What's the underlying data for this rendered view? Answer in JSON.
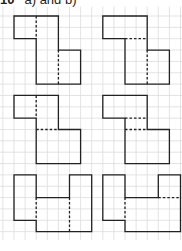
{
  "header": {
    "number": "10",
    "label": "a) and b)"
  },
  "grid": {
    "origin_x": 14,
    "origin_y": 16,
    "cell_w": 11.1,
    "cell_h": 11.35,
    "i_min": -1,
    "i_max": 16,
    "j_min": -1,
    "j_max": 20,
    "color": "#dcdcdc"
  },
  "style": {
    "outline_color": "#222222",
    "dash_color": "#222222"
  },
  "shapes": [
    {
      "name": "shape-row1-left",
      "outline": [
        [
          0,
          0
        ],
        [
          4,
          0
        ],
        [
          4,
          3
        ],
        [
          6,
          3
        ],
        [
          6,
          6
        ],
        [
          2,
          6
        ],
        [
          2,
          2
        ],
        [
          0,
          2
        ]
      ],
      "dashes": [
        [
          [
            2,
            0
          ],
          [
            2,
            2
          ]
        ],
        [
          [
            4,
            3
          ],
          [
            4,
            6
          ]
        ]
      ]
    },
    {
      "name": "shape-row1-right",
      "outline": [
        [
          8,
          0
        ],
        [
          12,
          0
        ],
        [
          12,
          3
        ],
        [
          14,
          3
        ],
        [
          14,
          6
        ],
        [
          10,
          6
        ],
        [
          10,
          2
        ],
        [
          8,
          2
        ]
      ],
      "dashes": [
        [
          [
            10,
            2
          ],
          [
            12,
            2
          ]
        ],
        [
          [
            12,
            3
          ],
          [
            12,
            6
          ]
        ]
      ]
    },
    {
      "name": "shape-row2-left",
      "outline": [
        [
          0,
          7
        ],
        [
          4,
          7
        ],
        [
          4,
          10
        ],
        [
          6,
          10
        ],
        [
          6,
          13
        ],
        [
          2,
          13
        ],
        [
          2,
          9
        ],
        [
          0,
          9
        ]
      ],
      "dashes": [
        [
          [
            2,
            7
          ],
          [
            2,
            9
          ]
        ],
        [
          [
            2,
            10
          ],
          [
            4,
            10
          ]
        ]
      ]
    },
    {
      "name": "shape-row2-right",
      "outline": [
        [
          8,
          7
        ],
        [
          12,
          7
        ],
        [
          12,
          10
        ],
        [
          14,
          10
        ],
        [
          14,
          13
        ],
        [
          10,
          13
        ],
        [
          10,
          9
        ],
        [
          8,
          9
        ]
      ],
      "dashes": [
        [
          [
            10,
            9
          ],
          [
            12,
            9
          ]
        ],
        [
          [
            10,
            10
          ],
          [
            12,
            10
          ]
        ]
      ]
    },
    {
      "name": "shape-row3-left",
      "outline": [
        [
          0,
          14
        ],
        [
          2,
          14
        ],
        [
          2,
          16
        ],
        [
          5,
          16
        ],
        [
          5,
          14
        ],
        [
          7,
          14
        ],
        [
          7,
          19
        ],
        [
          2,
          19
        ],
        [
          2,
          18
        ],
        [
          0,
          18
        ]
      ],
      "dashes": [
        [
          [
            2,
            16
          ],
          [
            2,
            18
          ]
        ],
        [
          [
            5,
            16
          ],
          [
            5,
            19
          ]
        ]
      ]
    },
    {
      "name": "shape-row3-right",
      "outline": [
        [
          8,
          14
        ],
        [
          10,
          14
        ],
        [
          10,
          16
        ],
        [
          13,
          16
        ],
        [
          13,
          14
        ],
        [
          15,
          14
        ],
        [
          15,
          19
        ],
        [
          10,
          19
        ],
        [
          10,
          18
        ],
        [
          8,
          18
        ]
      ],
      "dashes": [
        [
          [
            10,
            16
          ],
          [
            10,
            18
          ]
        ],
        [
          [
            13,
            16
          ],
          [
            15,
            16
          ]
        ]
      ]
    }
  ]
}
